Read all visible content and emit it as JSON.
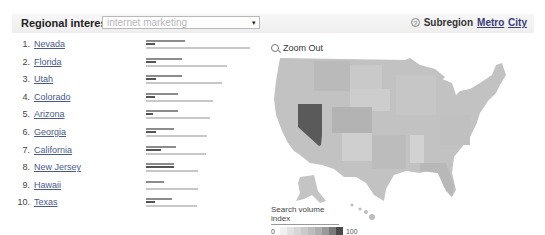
{
  "header": {
    "title": "Regional interest",
    "search_term": "internet marketing",
    "subregion_label": "Subregion",
    "links": [
      "Metro",
      "City"
    ],
    "help_icon": "?"
  },
  "regions": [
    {
      "rank": "1.",
      "name": "Nevada",
      "bars": [
        39,
        9,
        104
      ]
    },
    {
      "rank": "2.",
      "name": "Florida",
      "bars": [
        36,
        10,
        81
      ]
    },
    {
      "rank": "3.",
      "name": "Utah",
      "bars": [
        36,
        10,
        76
      ]
    },
    {
      "rank": "4.",
      "name": "Colorado",
      "bars": [
        32,
        9,
        67
      ]
    },
    {
      "rank": "5.",
      "name": "Arizona",
      "bars": [
        32,
        7,
        64
      ]
    },
    {
      "rank": "6.",
      "name": "Georgia",
      "bars": [
        28,
        10,
        61
      ]
    },
    {
      "rank": "7.",
      "name": "California",
      "bars": [
        30,
        15,
        60
      ]
    },
    {
      "rank": "8.",
      "name": "New Jersey",
      "bars": [
        28,
        28,
        52
      ]
    },
    {
      "rank": "9.",
      "name": "Hawaii",
      "bars": [
        18,
        0,
        52
      ]
    },
    {
      "rank": "10.",
      "name": "Texas",
      "bars": [
        26,
        9,
        51
      ]
    }
  ],
  "map": {
    "zoom_out_label": "Zoom Out",
    "highlight_color": "#5a5a5a",
    "base_color": "#bdbdbd",
    "legend": {
      "title": "Search volume index",
      "min": "0",
      "max": "100",
      "swatches": [
        "#f0f0f0",
        "#e2e2e2",
        "#d6d6d6",
        "#cacaca",
        "#bdbdbd",
        "#afafaf",
        "#9a9a9a",
        "#7a7a7a",
        "#4a4a4a"
      ]
    }
  }
}
